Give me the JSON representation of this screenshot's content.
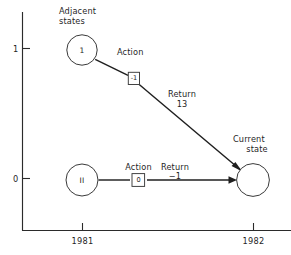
{
  "figure": {
    "type": "diagram",
    "axes": {
      "y_axis": {
        "tick_labels": [
          "1",
          "0"
        ],
        "tick_values": [
          1,
          0
        ]
      },
      "x_axis": {
        "tick_labels": [
          "1981",
          "1982"
        ],
        "tick_values": [
          "1981",
          "1982"
        ]
      },
      "grid": "off",
      "line_color": "#2b2b2b"
    },
    "annotations": {
      "adjacent_states": "Adjacent\nstates",
      "adjacent_states_line1": "Adjacent",
      "adjacent_states_line2": "states",
      "current_state_line1": "Current",
      "current_state_line2": "state"
    },
    "nodes": [
      {
        "id": "adjacent-state-upper",
        "label": "1",
        "x_year": "1981",
        "y_value": 1
      },
      {
        "id": "adjacent-state-lower",
        "label": "II",
        "x_year": "1981",
        "y_value": 0
      },
      {
        "id": "current-state",
        "label": "",
        "x_year": "1982",
        "y_value": 0
      }
    ],
    "transitions": [
      {
        "id": "transition-upper",
        "from": "adjacent-state-upper",
        "to": "current-state",
        "action_label": "Action",
        "action_value": "-1",
        "return_label": "Return",
        "return_value": "13"
      },
      {
        "id": "transition-lower",
        "from": "adjacent-state-lower",
        "to": "current-state",
        "action_label": "Action",
        "action_value": "0",
        "return_label": "Return",
        "return_value": "−1"
      }
    ]
  }
}
